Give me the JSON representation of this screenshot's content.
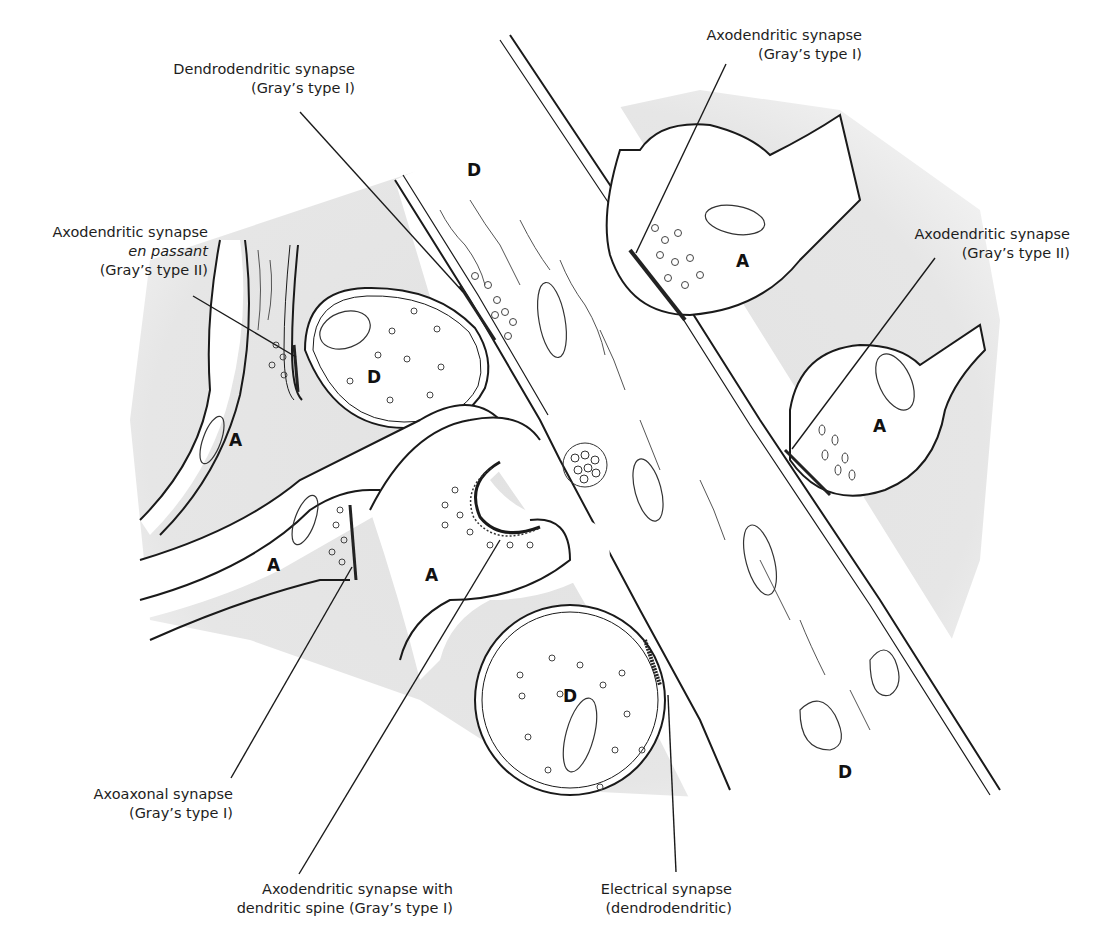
{
  "figure": {
    "colors": {
      "background": "#ffffff",
      "extracellular_shading": "#e4e4e4",
      "membrane": "#1a1a1a",
      "label_text": "#1d1d1d"
    }
  },
  "labels": {
    "dendrodendritic": {
      "line1": "Dendrodendritic synapse",
      "line2": "(Gray’s type I)"
    },
    "axodendritic_top": {
      "line1": "Axodendritic synapse",
      "line2": "(Gray’s type I)"
    },
    "en_passant": {
      "line1": "Axodendritic synapse",
      "line2": "en passant",
      "line3": "(Gray’s type II)"
    },
    "axodendritic_right": {
      "line1": "Axodendritic synapse",
      "line2": "(Gray’s type II)"
    },
    "axoaxonal": {
      "line1": "Axoaxonal synapse",
      "line2": "(Gray’s type I)"
    },
    "spine": {
      "line1": "Axodendritic synapse with",
      "line2": "dendritic spine (Gray’s type I)"
    },
    "electrical": {
      "line1": "Electrical synapse",
      "line2": "(dendrodendritic)"
    }
  },
  "region_markers": {
    "axon": "A",
    "dendrite": "D",
    "instances": [
      {
        "id": "d-top",
        "text": "D"
      },
      {
        "id": "d-left-bouton",
        "text": "D"
      },
      {
        "id": "d-lower-bouton",
        "text": "D"
      },
      {
        "id": "d-bottom-right",
        "text": "D"
      },
      {
        "id": "a-top-right",
        "text": "A"
      },
      {
        "id": "a-right",
        "text": "A"
      },
      {
        "id": "a-left",
        "text": "A"
      },
      {
        "id": "a-lower-left",
        "text": "A"
      },
      {
        "id": "a-center",
        "text": "A"
      }
    ]
  }
}
